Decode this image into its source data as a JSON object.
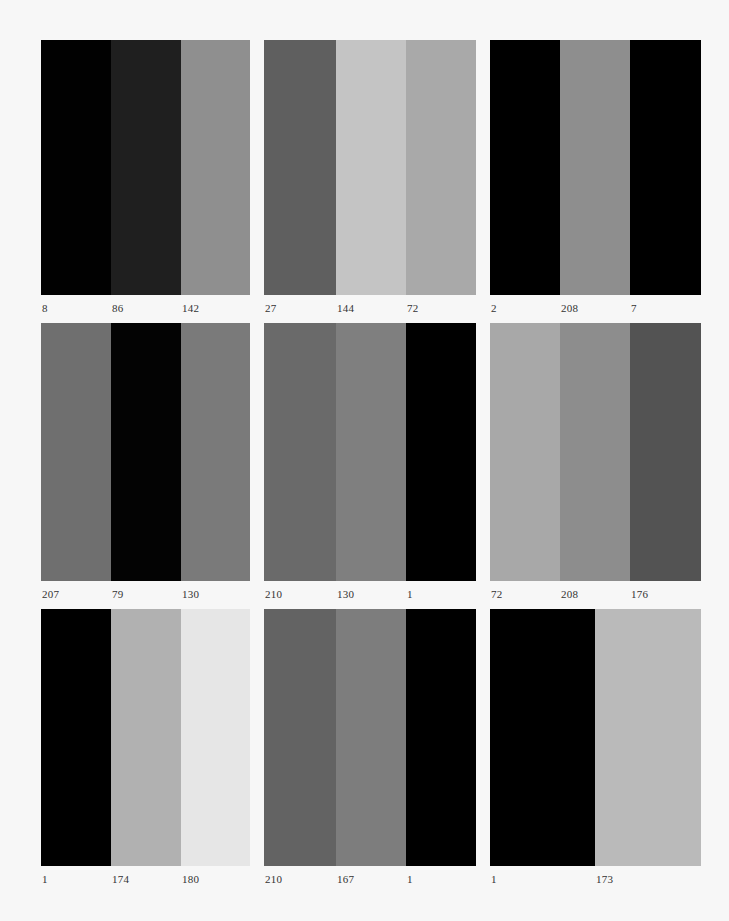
{
  "chart_data": {
    "type": "heatmap",
    "title": "",
    "layout": {
      "rows": 3,
      "cols": 3,
      "grid": false,
      "legend": "none"
    },
    "panels": [
      {
        "row": 0,
        "col": 0,
        "labels": [
          "8",
          "86",
          "142"
        ],
        "colors": [
          "#010101",
          "#1f1f1f",
          "#8f8f8f"
        ],
        "widths": [
          70,
          70,
          69
        ]
      },
      {
        "row": 0,
        "col": 1,
        "labels": [
          "27",
          "144",
          "72"
        ],
        "colors": [
          "#5f5f5f",
          "#c4c4c4",
          "#a9a9a9"
        ],
        "widths": [
          72,
          70,
          70
        ]
      },
      {
        "row": 0,
        "col": 2,
        "labels": [
          "2",
          "208",
          "7"
        ],
        "colors": [
          "#000000",
          "#8e8e8e",
          "#000000"
        ],
        "widths": [
          70,
          70,
          71
        ]
      },
      {
        "row": 1,
        "col": 0,
        "labels": [
          "207",
          "79",
          "130"
        ],
        "colors": [
          "#6f6f6f",
          "#030303",
          "#7a7a7a"
        ],
        "widths": [
          70,
          70,
          69
        ]
      },
      {
        "row": 1,
        "col": 1,
        "labels": [
          "210",
          "130",
          "1"
        ],
        "colors": [
          "#6a6a6a",
          "#7f7f7f",
          "#000000"
        ],
        "widths": [
          72,
          70,
          70
        ]
      },
      {
        "row": 1,
        "col": 2,
        "labels": [
          "72",
          "208",
          "176"
        ],
        "colors": [
          "#a8a8a8",
          "#8d8d8d",
          "#535353"
        ],
        "widths": [
          70,
          70,
          71
        ]
      },
      {
        "row": 2,
        "col": 0,
        "labels": [
          "1",
          "174",
          "180"
        ],
        "colors": [
          "#000000",
          "#b1b1b1",
          "#e6e6e6"
        ],
        "widths": [
          70,
          70,
          69
        ]
      },
      {
        "row": 2,
        "col": 1,
        "labels": [
          "210",
          "167",
          "1"
        ],
        "colors": [
          "#636363",
          "#7d7d7d",
          "#000000"
        ],
        "widths": [
          72,
          70,
          70
        ]
      },
      {
        "row": 2,
        "col": 2,
        "labels": [
          "1",
          "173"
        ],
        "colors": [
          "#000000",
          "#bababa"
        ],
        "widths": [
          105,
          106
        ]
      }
    ]
  },
  "geometry": {
    "col_x": [
      41,
      264,
      490
    ],
    "row_y": [
      40,
      323,
      609
    ],
    "panel_height": [
      255,
      258,
      257
    ],
    "label_offset": 7
  },
  "colors": {
    "background": "#f7f7f7",
    "label_text": "#333333"
  }
}
